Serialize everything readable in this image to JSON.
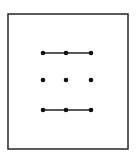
{
  "diagram": {
    "type": "dot-grid-pattern",
    "colors": {
      "background": "#ffffff",
      "frame": "#333333",
      "dot": "#111111",
      "line": "#222222"
    },
    "frame": {
      "x": 8,
      "y": 14,
      "width": 120,
      "height": 135
    },
    "grid": {
      "columns_x": [
        43,
        66,
        91
      ],
      "rows_y": [
        53,
        80,
        110
      ]
    },
    "dots": [
      {
        "row": 0,
        "col": 0
      },
      {
        "row": 0,
        "col": 1
      },
      {
        "row": 0,
        "col": 2
      },
      {
        "row": 1,
        "col": 0
      },
      {
        "row": 1,
        "col": 1
      },
      {
        "row": 1,
        "col": 2
      },
      {
        "row": 2,
        "col": 0
      },
      {
        "row": 2,
        "col": 1
      },
      {
        "row": 2,
        "col": 2
      }
    ],
    "segments": [
      {
        "from": {
          "row": 0,
          "col": 0
        },
        "to": {
          "row": 0,
          "col": 2
        }
      },
      {
        "from": {
          "row": 2,
          "col": 0
        },
        "to": {
          "row": 2,
          "col": 2
        }
      }
    ]
  }
}
